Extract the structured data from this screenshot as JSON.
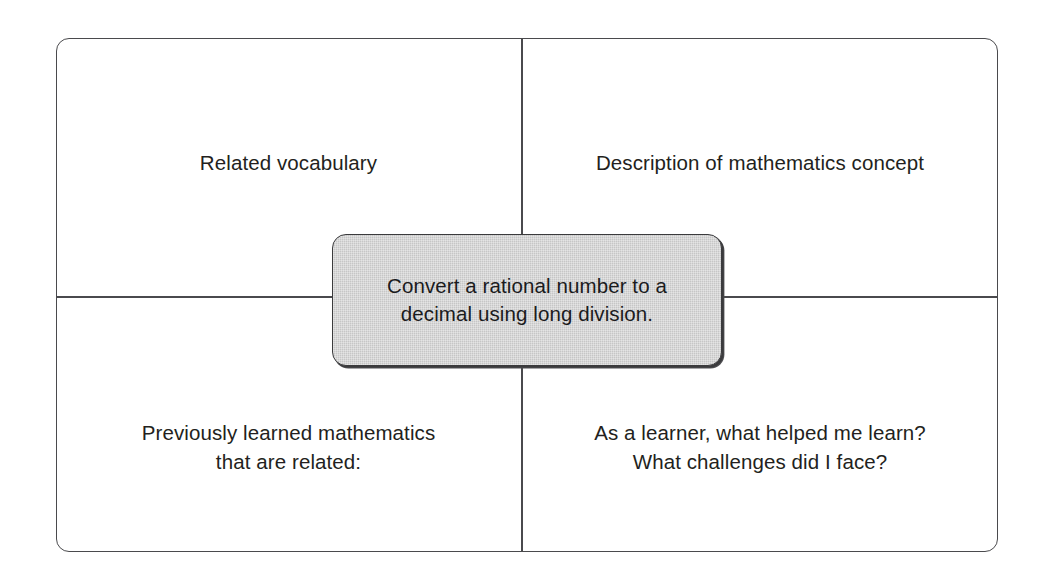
{
  "diagram": {
    "type": "four-quadrant concept reflection organizer",
    "center": {
      "text": "Convert a rational number to a\ndecimal using long division."
    },
    "quadrants": [
      {
        "position": "top-left",
        "label": "Related vocabulary"
      },
      {
        "position": "top-right",
        "label": "Description of mathematics concept"
      },
      {
        "position": "bottom-left",
        "label": "Previously learned mathematics\nthat are related:"
      },
      {
        "position": "bottom-right",
        "label": "As a learner, what helped me learn?\nWhat challenges did I face?"
      }
    ],
    "colors": {
      "page_background": "#ffffff",
      "frame_border": "#4a4a4d",
      "divider": "#4a4a4d",
      "center_box_fill": "#cdcdcd",
      "center_box_border": "#3b3b3d",
      "text": "#231f20"
    }
  }
}
